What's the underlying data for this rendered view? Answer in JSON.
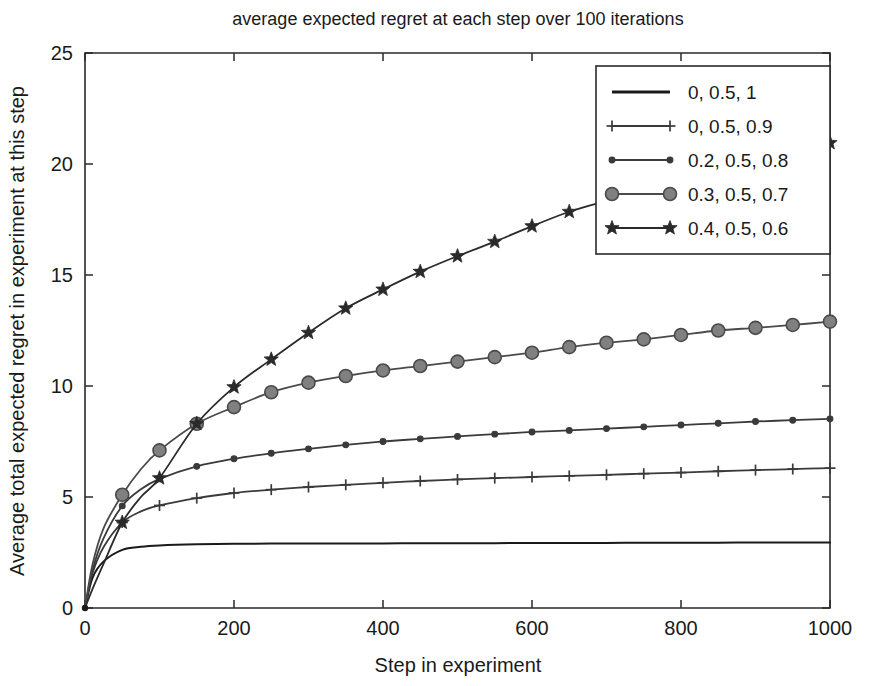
{
  "chart_data": {
    "type": "line",
    "title": "average expected regret at each step over 100 iterations",
    "xlabel": "Step in experiment",
    "ylabel": "Average total expected regret in experiment at this step",
    "xlim": [
      0,
      1000
    ],
    "ylim": [
      0,
      25
    ],
    "xticks": [
      0,
      200,
      400,
      600,
      800,
      1000
    ],
    "yticks": [
      0,
      5,
      10,
      15,
      20,
      25
    ],
    "xticklabels": [
      "0",
      "200",
      "400",
      "600",
      "800",
      "1000"
    ],
    "yticklabels": [
      "0",
      "5",
      "10",
      "15",
      "20",
      "25"
    ],
    "grid": false,
    "legend_position": "upper right",
    "x": [
      0,
      10,
      25,
      50,
      75,
      100,
      150,
      200,
      250,
      300,
      350,
      400,
      450,
      500,
      550,
      600,
      650,
      700,
      750,
      800,
      850,
      900,
      950,
      1000
    ],
    "series": [
      {
        "name": "0, 0.5, 1",
        "label": "0, 0.5, 1",
        "marker": "none",
        "color": "#1a1a1a",
        "marker_face": "#1a1a1a",
        "marker_every": 0,
        "values": [
          0,
          1.35,
          2.1,
          2.62,
          2.76,
          2.82,
          2.87,
          2.89,
          2.9,
          2.9,
          2.91,
          2.91,
          2.92,
          2.92,
          2.92,
          2.93,
          2.93,
          2.93,
          2.94,
          2.94,
          2.94,
          2.95,
          2.95,
          2.95
        ]
      },
      {
        "name": "0, 0.5, 0.9",
        "label": "0, 0.5, 0.9",
        "marker": "plus",
        "color": "#3a3a3a",
        "marker_face": "#3a3a3a",
        "marker_every": 50,
        "values": [
          0,
          1.55,
          2.75,
          3.85,
          4.35,
          4.62,
          4.95,
          5.18,
          5.33,
          5.45,
          5.55,
          5.64,
          5.72,
          5.79,
          5.85,
          5.9,
          5.95,
          6.0,
          6.05,
          6.1,
          6.16,
          6.21,
          6.26,
          6.3
        ]
      },
      {
        "name": "0.2, 0.5, 0.8",
        "label": "0.2, 0.5, 0.8",
        "marker": "smallcircle",
        "color": "#3a3a3a",
        "marker_face": "#3a3a3a",
        "marker_every": 50,
        "values": [
          0,
          1.7,
          3.15,
          4.6,
          5.35,
          5.82,
          6.38,
          6.72,
          6.97,
          7.17,
          7.35,
          7.5,
          7.62,
          7.73,
          7.83,
          7.93,
          8.0,
          8.08,
          8.16,
          8.24,
          8.32,
          8.4,
          8.46,
          8.52
        ]
      },
      {
        "name": "0.3, 0.5, 0.7",
        "label": "0.3, 0.5, 0.7",
        "marker": "circle",
        "color": "#4a4a4a",
        "marker_face": "#808080",
        "marker_every": 50,
        "values": [
          0,
          1.95,
          3.6,
          5.1,
          6.25,
          7.1,
          8.3,
          9.05,
          9.72,
          10.15,
          10.45,
          10.7,
          10.9,
          11.1,
          11.3,
          11.5,
          11.75,
          11.95,
          12.1,
          12.3,
          12.5,
          12.62,
          12.75,
          12.9
        ]
      },
      {
        "name": "0.4, 0.5, 0.6",
        "label": "0.4, 0.5, 0.6",
        "marker": "star",
        "color": "#2a2a2a",
        "marker_face": "#2a2a2a",
        "marker_every": 50,
        "values": [
          0,
          0.85,
          2.0,
          3.85,
          5.0,
          5.85,
          8.3,
          9.95,
          11.2,
          12.4,
          13.5,
          14.35,
          15.15,
          15.85,
          16.5,
          17.2,
          17.85,
          18.35,
          18.9,
          19.4,
          19.85,
          20.25,
          20.6,
          20.95
        ]
      }
    ]
  }
}
